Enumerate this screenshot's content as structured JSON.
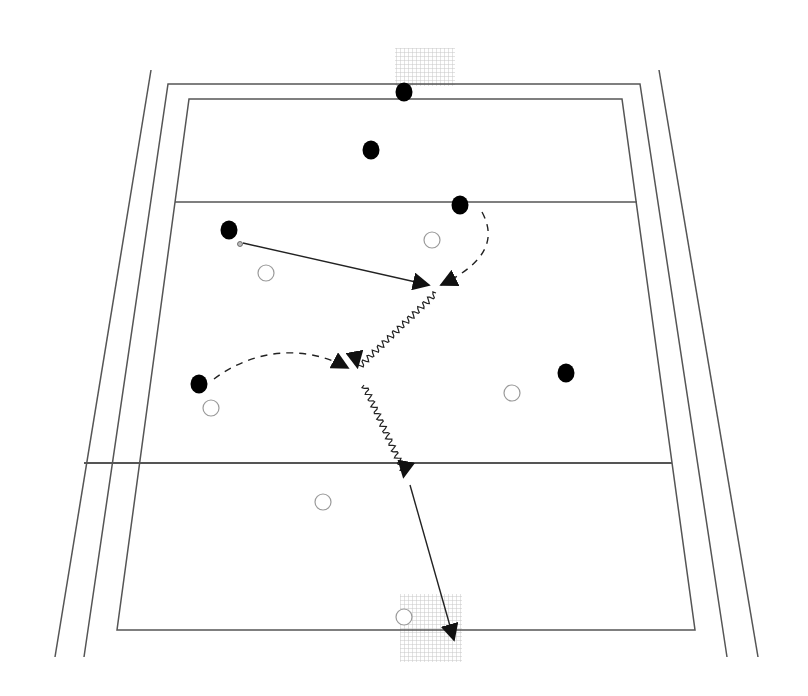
{
  "diagram": {
    "type": "sports-play-diagram",
    "sport": "field-court",
    "colors": {
      "background": "#ffffff",
      "line": "#555555",
      "attacker": "#000000",
      "defender_stroke": "#9a9a9a",
      "arrow": "#222222",
      "net": "#cfcfcf"
    },
    "court": {
      "outer_left_line": [
        [
          151,
          70
        ],
        [
          55,
          657
        ]
      ],
      "outer_right_line": [
        [
          659,
          70
        ],
        [
          758,
          657
        ]
      ],
      "boundary": [
        [
          168,
          84
        ],
        [
          640,
          84
        ],
        [
          727,
          657
        ],
        [
          84,
          657
        ]
      ],
      "field": [
        [
          189,
          99
        ],
        [
          622,
          99
        ],
        [
          695,
          630
        ],
        [
          117,
          630
        ]
      ],
      "upper_zone_line": [
        [
          175,
          202
        ],
        [
          637,
          202
        ]
      ],
      "lower_zone_line": [
        [
          84,
          463
        ],
        [
          672,
          463
        ]
      ]
    },
    "goals": [
      {
        "name": "top-goal",
        "x": 395,
        "y": 48,
        "w": 60,
        "h": 38
      },
      {
        "name": "bottom-goal",
        "x": 400,
        "y": 594,
        "w": 62,
        "h": 68
      }
    ],
    "attackers": [
      {
        "id": "a1",
        "x": 404,
        "y": 92
      },
      {
        "id": "a2",
        "x": 371,
        "y": 150
      },
      {
        "id": "a3",
        "x": 460,
        "y": 205
      },
      {
        "id": "a4",
        "x": 229,
        "y": 230
      },
      {
        "id": "a5",
        "x": 199,
        "y": 384
      },
      {
        "id": "a6",
        "x": 566,
        "y": 373
      }
    ],
    "defenders": [
      {
        "id": "d1",
        "x": 432,
        "y": 240
      },
      {
        "id": "d2",
        "x": 266,
        "y": 273
      },
      {
        "id": "d3",
        "x": 211,
        "y": 408
      },
      {
        "id": "d4",
        "x": 512,
        "y": 393
      },
      {
        "id": "d5",
        "x": 323,
        "y": 502
      },
      {
        "id": "d6",
        "x": 404,
        "y": 617
      }
    ],
    "ball": {
      "x": 240,
      "y": 244
    },
    "movements": [
      {
        "id": "m1",
        "kind": "pass",
        "style": "solid",
        "from": [
          243,
          243
        ],
        "to": [
          429,
          285
        ]
      },
      {
        "id": "m2",
        "kind": "run",
        "style": "dashed",
        "path": "M 482 212 C 496 238, 488 262, 441 285"
      },
      {
        "id": "m3",
        "kind": "dribble",
        "style": "wavy",
        "from": [
          436,
          293
        ],
        "to": [
          358,
          368
        ]
      },
      {
        "id": "m4",
        "kind": "run",
        "style": "dashed",
        "path": "M 214 379 C 250 352, 300 342, 348 368"
      },
      {
        "id": "m5",
        "kind": "dribble",
        "style": "wavy",
        "from": [
          364,
          385
        ],
        "to": [
          406,
          476
        ]
      },
      {
        "id": "m6",
        "kind": "shot",
        "style": "solid",
        "from": [
          410,
          485
        ],
        "to": [
          454,
          640
        ]
      }
    ]
  }
}
